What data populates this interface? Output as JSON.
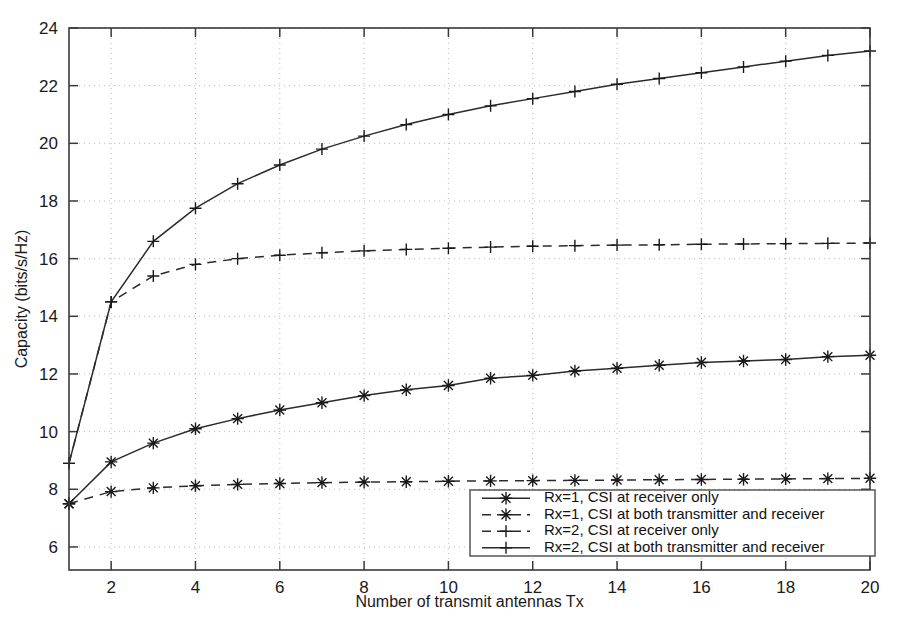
{
  "chart_data": {
    "type": "line",
    "title": "",
    "xlabel": "Number of transmit antennas Tx",
    "ylabel": "Capacity (bits/s/Hz)",
    "xlim": [
      1,
      20
    ],
    "ylim": [
      5.2,
      24
    ],
    "xticks": [
      2,
      4,
      6,
      8,
      10,
      12,
      14,
      16,
      18,
      20
    ],
    "yticks": [
      6,
      8,
      10,
      12,
      14,
      16,
      18,
      20,
      22,
      24
    ],
    "xtick_labels": [
      "2",
      "4",
      "6",
      "8",
      "10",
      "12",
      "14",
      "16",
      "18",
      "20"
    ],
    "ytick_labels": [
      "6",
      "8",
      "10",
      "12",
      "14",
      "16",
      "18",
      "20",
      "22",
      "24"
    ],
    "grid": true,
    "grid_style": "dotted",
    "legend_position": "lower right",
    "x": [
      1,
      2,
      3,
      4,
      5,
      6,
      7,
      8,
      9,
      10,
      11,
      12,
      13,
      14,
      15,
      16,
      17,
      18,
      19,
      20
    ],
    "series": [
      {
        "name": "Rx=1, CSI at receiver only",
        "marker": "star",
        "linestyle": "solid",
        "color": "#2b2b2b",
        "values": [
          7.5,
          8.95,
          9.6,
          10.1,
          10.45,
          10.75,
          11.0,
          11.25,
          11.45,
          11.6,
          11.85,
          11.95,
          12.1,
          12.2,
          12.3,
          12.4,
          12.45,
          12.5,
          12.6,
          12.65
        ]
      },
      {
        "name": "Rx=1, CSI at both transmitter and receiver",
        "marker": "star",
        "linestyle": "dashed",
        "color": "#2b2b2b",
        "values": [
          7.5,
          7.92,
          8.05,
          8.12,
          8.17,
          8.2,
          8.23,
          8.25,
          8.26,
          8.28,
          8.29,
          8.3,
          8.31,
          8.32,
          8.33,
          8.34,
          8.35,
          8.36,
          8.37,
          8.38
        ]
      },
      {
        "name": "Rx=2, CSI at receiver only",
        "marker": "plus",
        "linestyle": "dashed",
        "color": "#2b2b2b",
        "values": [
          8.9,
          14.5,
          15.4,
          15.8,
          16.0,
          16.12,
          16.2,
          16.27,
          16.32,
          16.36,
          16.4,
          16.43,
          16.45,
          16.47,
          16.48,
          16.5,
          16.51,
          16.52,
          16.53,
          16.54
        ]
      },
      {
        "name": "Rx=2, CSI at both transmitter and receiver",
        "marker": "plus",
        "linestyle": "solid",
        "color": "#2b2b2b",
        "values": [
          8.9,
          14.5,
          16.6,
          17.75,
          18.6,
          19.25,
          19.8,
          20.25,
          20.65,
          21.0,
          21.3,
          21.55,
          21.8,
          22.05,
          22.25,
          22.45,
          22.65,
          22.85,
          23.05,
          23.2
        ]
      }
    ]
  },
  "legend": {
    "entries": [
      "Rx=1, CSI at receiver only",
      "Rx=1, CSI at both transmitter and receiver",
      "Rx=2, CSI at receiver only",
      "Rx=2, CSI at both transmitter and receiver"
    ]
  },
  "colors": {
    "line": "#2b2b2b",
    "axis": "#3a3a3a",
    "grid": "#b9b9b9",
    "background": "#ffffff",
    "text": "#1a1a1a"
  }
}
